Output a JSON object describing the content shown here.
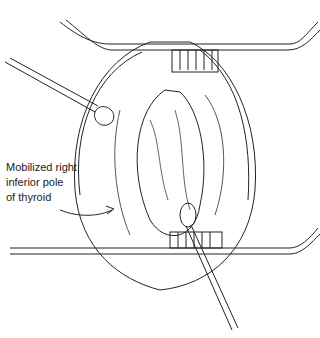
{
  "figure": {
    "label_lines": [
      "Mobilized right",
      "inferior pole",
      "of thyroid"
    ],
    "colors": {
      "ink": "#222222",
      "background": "#ffffff"
    }
  }
}
